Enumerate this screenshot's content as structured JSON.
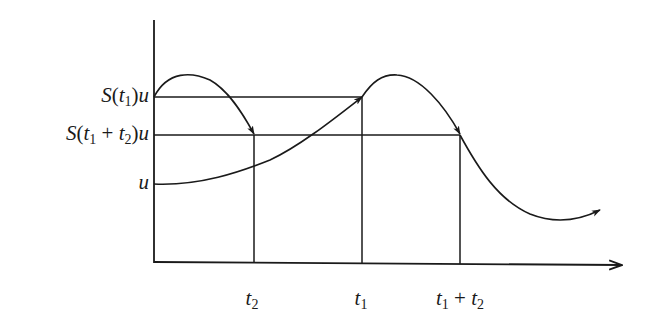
{
  "diagram": {
    "type": "semigroup-orbit-illustration",
    "y_labels": [
      {
        "id": "s_t1_u",
        "func": "S",
        "open": "(",
        "var1": "t",
        "sub1": "1",
        "plus": "",
        "var2": "",
        "sub2": "",
        "close": ")",
        "suffix": "u"
      },
      {
        "id": "s_t1t2_u",
        "func": "S",
        "open": "(",
        "var1": "t",
        "sub1": "1",
        "plus": " + ",
        "var2": "t",
        "sub2": "2",
        "close": ")",
        "suffix": "u"
      },
      {
        "id": "u",
        "func": "",
        "open": "",
        "var1": "",
        "sub1": "",
        "plus": "",
        "var2": "",
        "sub2": "",
        "close": "",
        "suffix": "u"
      }
    ],
    "x_labels": [
      {
        "id": "t2",
        "var1": "t",
        "sub1": "2",
        "plus": "",
        "var2": "",
        "sub2": ""
      },
      {
        "id": "t1",
        "var1": "t",
        "sub1": "1",
        "plus": "",
        "var2": "",
        "sub2": ""
      },
      {
        "id": "t1_plus_t2",
        "var1": "t",
        "sub1": "1",
        "plus": " + ",
        "var2": "t",
        "sub2": "2"
      }
    ],
    "colors": {
      "stroke": "#1a1a1a",
      "background": "#ffffff"
    }
  }
}
